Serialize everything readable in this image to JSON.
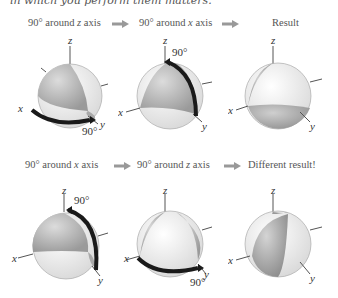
{
  "header": {
    "cut_text": "in which you perform them matters."
  },
  "rows": [
    {
      "step1": {
        "prefix": "90° around ",
        "axis": "z",
        "suffix": " axis"
      },
      "step2": {
        "prefix": "90° around ",
        "axis": "x",
        "suffix": " axis"
      },
      "result": "Result",
      "spheres": [
        {
          "rotation_label": "90°",
          "axes": {
            "x": "x",
            "y": "y",
            "z": "z"
          }
        },
        {
          "rotation_label": "90°",
          "axes": {
            "x": "x",
            "y": "y",
            "z": "z"
          }
        },
        {
          "axes": {
            "x": "x",
            "y": "y",
            "z": "z"
          }
        }
      ]
    },
    {
      "step1": {
        "prefix": "90° around ",
        "axis": "x",
        "suffix": " axis"
      },
      "step2": {
        "prefix": "90° around ",
        "axis": "z",
        "suffix": " axis"
      },
      "result": "Different result!",
      "spheres": [
        {
          "rotation_label": "90°",
          "axes": {
            "x": "x",
            "y": "y",
            "z": "z"
          }
        },
        {
          "rotation_label": "90°",
          "axes": {
            "x": "x",
            "y": "y",
            "z": "z"
          }
        },
        {
          "axes": {
            "x": "x",
            "y": "y",
            "z": "z"
          }
        }
      ]
    }
  ],
  "colors": {
    "sphere_gray": "#b8b8b8",
    "sphere_white": "#f4f4f4",
    "arrow": "#999999",
    "rot_arrow": "#1a1a1a"
  }
}
